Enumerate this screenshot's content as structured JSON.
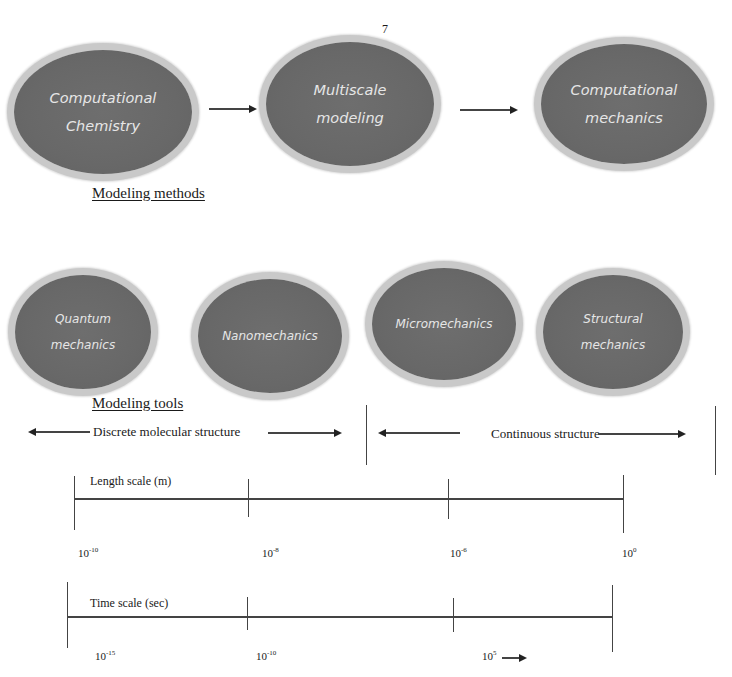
{
  "page_number": "7",
  "modeling_methods": {
    "heading": "Modeling methods",
    "nodes": [
      {
        "line1": "Computational",
        "line2": "Chemistry"
      },
      {
        "line1": "Multiscale",
        "line2": "modeling"
      },
      {
        "line1": "Computational",
        "line2": "mechanics"
      }
    ]
  },
  "modeling_tools": {
    "heading": "Modeling tools",
    "nodes": [
      {
        "line1": "Quantum",
        "line2": "mechanics"
      },
      {
        "line1": "Nanomechanics",
        "line2": ""
      },
      {
        "line1": "Micromechanics",
        "line2": ""
      },
      {
        "line1": "Structural",
        "line2": "mechanics"
      }
    ]
  },
  "structure_ranges": {
    "discrete": "Discrete molecular structure",
    "continuous": "Continuous structure"
  },
  "length_scale": {
    "label": "Length scale (m)",
    "ticks": [
      {
        "base": "10",
        "exp": "-10"
      },
      {
        "base": "10",
        "exp": "-8"
      },
      {
        "base": "10",
        "exp": "-6"
      },
      {
        "base": "10",
        "exp": "0"
      }
    ]
  },
  "time_scale": {
    "label": "Time scale (sec)",
    "ticks": [
      {
        "base": "10",
        "exp": "-15"
      },
      {
        "base": "10",
        "exp": "-10"
      },
      {
        "base": "10",
        "exp": "5"
      }
    ]
  },
  "colors": {
    "ellipse_fill": "#686868",
    "ellipse_border": "#c9c9c9",
    "ellipse_text": "#e6e6e6",
    "line": "#444444"
  }
}
